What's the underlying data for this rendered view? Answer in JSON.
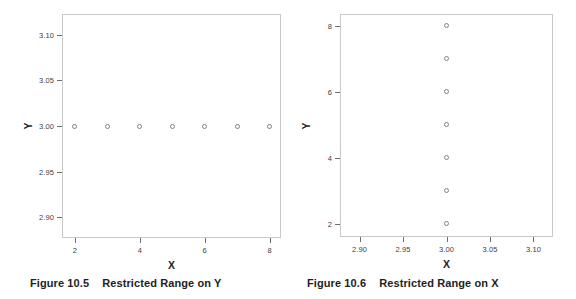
{
  "page": {
    "background_color": "#ffffff",
    "text_color": "#231f20",
    "frame_color": "#c9c9c9",
    "marker_color": "#808285"
  },
  "chart_data": [
    {
      "type": "scatter",
      "id": "figure-10-5",
      "title": "",
      "xlabel": "X",
      "ylabel": "Y",
      "xlim": [
        1.6,
        8.35
      ],
      "ylim": [
        2.8775,
        3.1225
      ],
      "xticks": [
        2,
        4,
        6,
        8
      ],
      "xticklabels": [
        "2",
        "4",
        "6",
        "8"
      ],
      "yticks": [
        2.9,
        2.95,
        3.0,
        3.05,
        3.1
      ],
      "yticklabels": [
        "2.90",
        "2.95",
        "3.00",
        "3.05",
        "3.10"
      ],
      "grid": false,
      "legend": null,
      "series": [
        {
          "name": "points",
          "marker": "open-circle",
          "x": [
            2,
            3,
            4,
            5,
            6,
            7,
            8
          ],
          "y": [
            3.0,
            3.0,
            3.0,
            3.0,
            3.0,
            3.0,
            3.0
          ]
        }
      ],
      "caption": {
        "number": "Figure 10.5",
        "text": "Restricted Range on Y"
      }
    },
    {
      "type": "scatter",
      "id": "figure-10-6",
      "title": "",
      "xlabel": "X",
      "ylabel": "Y",
      "xlim": [
        2.8775,
        3.1225
      ],
      "ylim": [
        1.6,
        8.35
      ],
      "xticks": [
        2.9,
        2.95,
        3.0,
        3.05,
        3.1
      ],
      "xticklabels": [
        "2.90",
        "2.95",
        "3.00",
        "3.05",
        "3.10"
      ],
      "yticks": [
        2,
        4,
        6,
        8
      ],
      "yticklabels": [
        "2",
        "4",
        "6",
        "8"
      ],
      "grid": false,
      "legend": null,
      "series": [
        {
          "name": "points",
          "marker": "open-circle",
          "x": [
            3.0,
            3.0,
            3.0,
            3.0,
            3.0,
            3.0,
            3.0
          ],
          "y": [
            2,
            3,
            4,
            5,
            6,
            7,
            8
          ]
        }
      ],
      "caption": {
        "number": "Figure 10.6",
        "text": "Restricted Range on X"
      }
    }
  ]
}
